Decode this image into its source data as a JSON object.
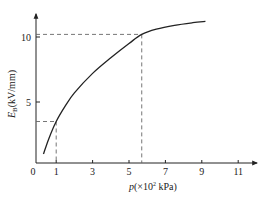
{
  "chart_data": {
    "type": "line",
    "title": "",
    "xlabel": "p(×10² kPa)",
    "ylabel": "E_B(kV/mm)",
    "xlabel_parts": {
      "var": "p",
      "unit": "(×10",
      "sup": "2",
      "unit_end": " kPa)"
    },
    "ylabel_parts": {
      "var": "E",
      "sub": "B",
      "unit": "(kV/mm)"
    },
    "x_ticks": [
      0,
      1,
      3,
      5,
      7,
      9,
      11
    ],
    "y_ticks": [
      5,
      10
    ],
    "xlim": [
      0,
      12
    ],
    "ylim": [
      0,
      12
    ],
    "grid": false,
    "legend": null,
    "series": [
      {
        "name": "E_B vs p",
        "x": [
          0.3,
          0.6,
          1.0,
          1.5,
          2.0,
          3.0,
          4.0,
          5.0,
          5.7,
          6.5,
          7.5,
          8.5,
          9.2
        ],
        "y": [
          1.0,
          2.2,
          3.5,
          4.7,
          5.7,
          7.2,
          8.4,
          9.5,
          10.2,
          10.6,
          10.9,
          11.1,
          11.2
        ]
      }
    ],
    "annotations": [
      {
        "type": "dashed-guide",
        "x": 1.0,
        "y": 3.5
      },
      {
        "type": "dashed-guide",
        "x": 5.7,
        "y": 10.2
      }
    ]
  },
  "labels": {
    "origin": "0",
    "x1": "1",
    "x3": "3",
    "x5": "5",
    "x7": "7",
    "x9": "9",
    "x11": "11",
    "y5": "5",
    "y10": "10"
  }
}
